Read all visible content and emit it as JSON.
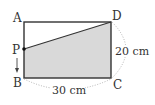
{
  "diagram": {
    "type": "geometry-rectangle",
    "vertices": {
      "A": {
        "label": "A"
      },
      "B": {
        "label": "B"
      },
      "C": {
        "label": "C"
      },
      "D": {
        "label": "D"
      },
      "P": {
        "label": "P"
      }
    },
    "measurements": {
      "bc": "30 cm",
      "cd": "20 cm"
    },
    "shaded_region": "PBCD",
    "motion": "P moves downward from A toward B",
    "colors": {
      "stroke": "#333333",
      "fill": "#d9d9d9",
      "dotted": "#aaaaaa"
    }
  }
}
